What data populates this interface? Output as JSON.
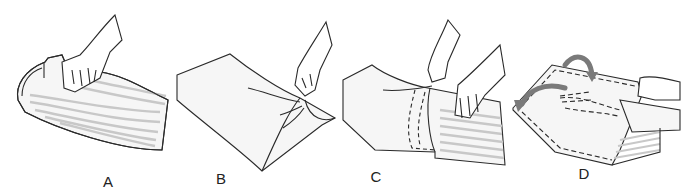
{
  "figure": {
    "panels": [
      {
        "id": "A",
        "label": "A",
        "label_pos": [
          108,
          181
        ],
        "description": "hand gripping striped pillow, pushing into pillowcase"
      },
      {
        "id": "B",
        "label": "B",
        "label_pos": [
          221,
          178
        ],
        "description": "hand holding corner of plain pillowcase"
      },
      {
        "id": "C",
        "label": "C",
        "label_pos": [
          376,
          176
        ],
        "description": "two hands pulling case over striped pillow, dashed outline inside"
      },
      {
        "id": "D",
        "label": "D",
        "label_pos": [
          584,
          173
        ],
        "description": "pillow in case with curved arrows showing folding, dashed hand inside"
      }
    ],
    "colors": {
      "line": "#2a2a2a",
      "stripe": "#c8c8c8",
      "fabric": "#f6f6f6",
      "arrow": "#7a7a7a"
    }
  }
}
